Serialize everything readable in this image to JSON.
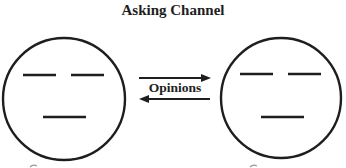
{
  "title": "Asking Channel",
  "channel": {
    "label": "Opinions",
    "arrows": [
      {
        "direction": "right",
        "from": "left-face",
        "to": "right-face"
      },
      {
        "direction": "left",
        "from": "right-face",
        "to": "left-face"
      }
    ]
  },
  "faces": [
    {
      "id": "left-face",
      "expression": "neutral"
    },
    {
      "id": "right-face",
      "expression": "neutral"
    }
  ],
  "colors": {
    "stroke": "#1e1e1e",
    "background": "#ffffff"
  }
}
